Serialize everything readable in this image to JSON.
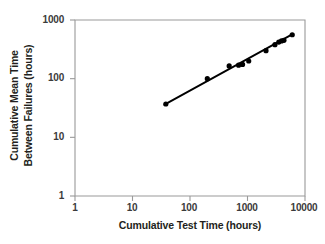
{
  "chart_data": {
    "type": "scatter",
    "title": "",
    "subtitle": "",
    "xlabel": "Cumulative Test Time (hours)",
    "ylabel_line1": "Cumulative Mean Time",
    "ylabel_line2": "Between Failures (hours)",
    "xscale": "log",
    "yscale": "log",
    "xlim": [
      1,
      10000
    ],
    "ylim": [
      1,
      1000
    ],
    "xticks": [
      "1",
      "10",
      "100",
      "1000",
      "10000"
    ],
    "xtick_values": [
      1,
      10,
      100,
      1000,
      10000
    ],
    "yticks": [
      "1000",
      "100",
      "10",
      "1"
    ],
    "ytick_values": [
      1000,
      100,
      10,
      1
    ],
    "grid": false,
    "legend": "none",
    "marker": "filled-circle",
    "marker_color": "#000000",
    "line_color": "#000000",
    "axis_color": "#9a9a9a",
    "background": "#ffffff",
    "series": [
      {
        "name": "Cumulative MTBF",
        "x": [
          38,
          200,
          480,
          700,
          820,
          1050,
          2100,
          3000,
          3500,
          3900,
          4300,
          6000
        ],
        "y": [
          37,
          100,
          165,
          170,
          175,
          200,
          300,
          380,
          420,
          440,
          450,
          560
        ]
      }
    ],
    "trend_line": {
      "name": "Duane growth line",
      "x": [
        36,
        6200
      ],
      "y": [
        36,
        580
      ]
    },
    "annotations": []
  }
}
